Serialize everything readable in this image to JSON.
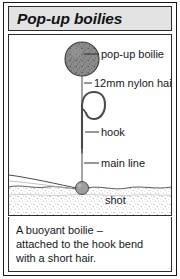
{
  "figure": {
    "title": "Pop-up boilies",
    "diagram": {
      "labels": [
        {
          "id": "pop-up-boilie",
          "text": "pop-up boilie"
        },
        {
          "id": "nylon-hair",
          "text": "12mm nylon hair"
        },
        {
          "id": "hook",
          "text": "hook"
        },
        {
          "id": "main-line",
          "text": "main line"
        },
        {
          "id": "shot",
          "text": "shot"
        }
      ],
      "elements": {
        "boilie_fill": "#8a8a8a",
        "boilie_stroke": "#3c3c3c",
        "shot_fill": "#9a9a9a",
        "line_color": "#4a4a4a",
        "lakebed_color": "#b8b8b8"
      }
    },
    "caption": {
      "lines": [
        "A buoyant boilie –",
        "attached to the hook bend",
        "with a short hair."
      ]
    },
    "colors": {
      "frame": "#16181a",
      "title_background": "#e3e3e3",
      "text": "#16181a",
      "page_background": "#ffffff"
    }
  }
}
